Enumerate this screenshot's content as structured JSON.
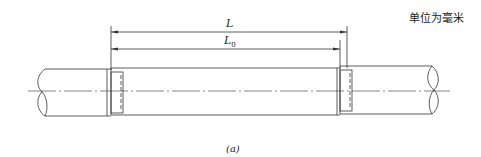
{
  "figure": {
    "unit_note": "单位为毫米",
    "caption": "(a)",
    "dimensions": [
      {
        "label": "L",
        "subscript": "",
        "description": "overall length"
      },
      {
        "label": "L",
        "subscript": "0",
        "description": "effective length"
      }
    ],
    "components": [
      "left-pipe",
      "center-pipe",
      "right-pipe",
      "left-joint",
      "right-joint",
      "centerline"
    ],
    "colors": {
      "line": "#333333",
      "background": "#ffffff"
    }
  }
}
